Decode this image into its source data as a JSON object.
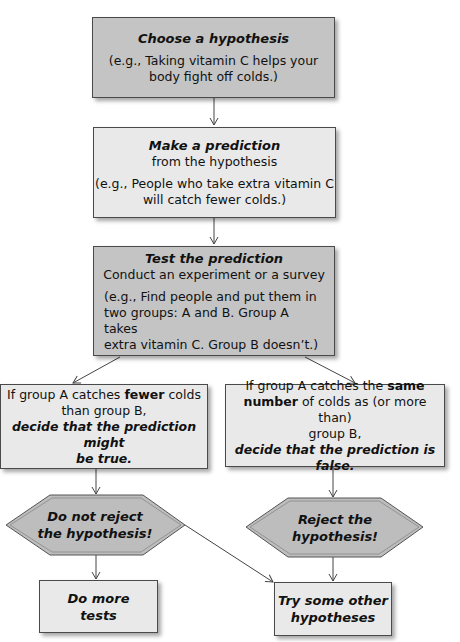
{
  "step1": {
    "title": "Choose a hypothesis",
    "example_line1": "(e.g., Taking vitamin C helps your",
    "example_line2": "body fight off colds.)"
  },
  "step2": {
    "title": "Make a prediction",
    "subtitle": "from the hypothesis",
    "example_line1": "(e.g., People who take extra vitamin C",
    "example_line2": "will catch fewer colds.)"
  },
  "step3": {
    "title": "Test the prediction",
    "subtitle": "Conduct an experiment or a survey",
    "example_line1": "(e.g., Find people and put them in",
    "example_line2": "two groups: A and B. Group A takes",
    "example_line3": "extra vitamin C. Group B doesn’t.)"
  },
  "outcome_left": {
    "pre": "If group A catches ",
    "bold": "fewer",
    "post": " colds",
    "line2": "than group B,",
    "conclusion_line1": "decide that the prediction might",
    "conclusion_line2": "be true."
  },
  "outcome_right": {
    "pre": "If group A catches the ",
    "bold1": "same",
    "bold2": "number",
    "post": " of colds as (or more than)",
    "line3": "group B,",
    "conclusion": "decide that the prediction is false."
  },
  "decision_left": {
    "line1": "Do not reject",
    "line2": "the hypothesis!"
  },
  "decision_right": {
    "line1": "Reject the",
    "line2": "hypothesis!"
  },
  "result_left": {
    "line1": "Do more",
    "line2": "tests"
  },
  "result_right": {
    "line1": "Try some other",
    "line2": "hypotheses"
  },
  "colors": {
    "dark_fill": "#c4c4c4",
    "light_fill": "#e9e9e9",
    "hex_fill": "#bdbdbd",
    "line": "#4a4a4a"
  }
}
